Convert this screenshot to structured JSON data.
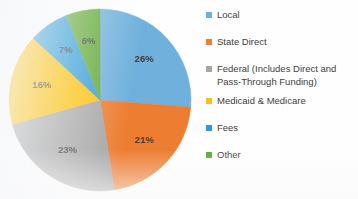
{
  "chart_data": {
    "type": "pie",
    "title": "",
    "subtitle": "",
    "xlabel": "",
    "ylabel": "",
    "legend_position": "right",
    "grid": false,
    "start_angle_deg": 0,
    "direction": "clockwise",
    "categories": [
      "Local",
      "State Direct",
      "Federal (Includes Direct and Pass-Through Funding)",
      "Medicaid & Medicare",
      "Fees",
      "Other"
    ],
    "values": [
      26,
      21,
      23,
      16,
      7,
      6
    ],
    "value_labels": [
      "26%",
      "21%",
      "23%",
      "16%",
      "7%",
      "6%"
    ],
    "colors": [
      "#6fb0dc",
      "#ed7d31",
      "#a5a5a5",
      "#ffc000",
      "#2e9bd6",
      "#5fa832"
    ],
    "slices": [
      {
        "label": "Local",
        "value": 26,
        "display": "26%",
        "color": "#6fb0dc"
      },
      {
        "label": "State Direct",
        "value": 21,
        "display": "21%",
        "color": "#ed7d31"
      },
      {
        "label": "Federal (Includes Direct and Pass-Through Funding)",
        "value": 23,
        "display": "23%",
        "color": "#a5a5a5"
      },
      {
        "label": "Medicaid & Medicare",
        "value": 16,
        "display": "16%",
        "color": "#ffc000"
      },
      {
        "label": "Fees",
        "value": 7,
        "display": "7%",
        "color": "#2e9bd6"
      },
      {
        "label": "Other",
        "value": 6,
        "display": "6%",
        "color": "#5fa832"
      }
    ]
  },
  "legend": {
    "entries": [
      {
        "label": "Local",
        "color": "#6fb0dc"
      },
      {
        "label": "State Direct",
        "color": "#ed7d31"
      },
      {
        "label": "Federal (Includes Direct and\nPass-Through Funding)",
        "color": "#a5a5a5"
      },
      {
        "label": "Medicaid & Medicare",
        "color": "#ffc000"
      },
      {
        "label": "Fees",
        "color": "#2e9bd6"
      },
      {
        "label": "Other",
        "color": "#5fa832"
      }
    ]
  },
  "geometry": {
    "center_x": 100,
    "center_y": 100,
    "radius": 91,
    "label_radius_fraction": 0.66
  },
  "style": {
    "background": "#ffffff",
    "label_text_color": "#3f3f3f",
    "legend_text_color": "#3f3f3f"
  }
}
